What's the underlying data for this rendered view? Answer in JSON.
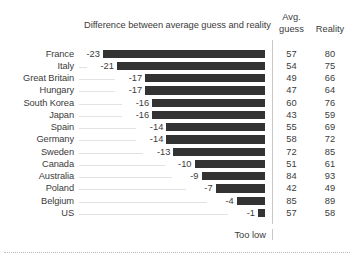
{
  "chart_data": {
    "type": "bar",
    "title": "",
    "subtitle": "Difference between average guess and reality",
    "xlabel": "",
    "ylabel": "",
    "orientation": "horizontal",
    "direction": "negative-right-aligned",
    "grid": false,
    "legend": null,
    "axis_note": "Too low",
    "xlim": [
      -23,
      0
    ],
    "columns": [
      "Difference between average guess and reality",
      "Avg. guess",
      "Reality"
    ],
    "column_headers": {
      "avg_line1": "Avg.",
      "avg_line2": "guess",
      "reality": "Reality"
    },
    "categories": [
      "France",
      "Italy",
      "Great Britain",
      "Hungary",
      "South Korea",
      "Japan",
      "Spain",
      "Germany",
      "Sweden",
      "Canada",
      "Australia",
      "Poland",
      "Belgium",
      "US"
    ],
    "values": [
      -23,
      -21,
      -17,
      -17,
      -16,
      -16,
      -14,
      -14,
      -13,
      -10,
      -9,
      -7,
      -4,
      -1
    ],
    "series": [
      {
        "name": "Difference",
        "values": [
          -23,
          -21,
          -17,
          -17,
          -16,
          -16,
          -14,
          -14,
          -13,
          -10,
          -9,
          -7,
          -4,
          -1
        ]
      },
      {
        "name": "Avg. guess",
        "values": [
          57,
          54,
          49,
          47,
          60,
          43,
          55,
          58,
          72,
          51,
          84,
          42,
          85,
          57
        ]
      },
      {
        "name": "Reality",
        "values": [
          80,
          75,
          66,
          64,
          76,
          59,
          69,
          72,
          85,
          61,
          93,
          49,
          89,
          58
        ]
      }
    ],
    "rows": [
      {
        "country": "France",
        "diff": "-23",
        "value": -23,
        "guess": "57",
        "reality": "80"
      },
      {
        "country": "Italy",
        "diff": "-21",
        "value": -21,
        "guess": "54",
        "reality": "75"
      },
      {
        "country": "Great Britain",
        "diff": "-17",
        "value": -17,
        "guess": "49",
        "reality": "66"
      },
      {
        "country": "Hungary",
        "diff": "-17",
        "value": -17,
        "guess": "47",
        "reality": "64"
      },
      {
        "country": "South Korea",
        "diff": "-16",
        "value": -16,
        "guess": "60",
        "reality": "76"
      },
      {
        "country": "Japan",
        "diff": "-16",
        "value": -16,
        "guess": "43",
        "reality": "59"
      },
      {
        "country": "Spain",
        "diff": "-14",
        "value": -14,
        "guess": "55",
        "reality": "69"
      },
      {
        "country": "Germany",
        "diff": "-14",
        "value": -14,
        "guess": "58",
        "reality": "72"
      },
      {
        "country": "Sweden",
        "diff": "-13",
        "value": -13,
        "guess": "72",
        "reality": "85"
      },
      {
        "country": "Canada",
        "diff": "-10",
        "value": -10,
        "guess": "51",
        "reality": "61"
      },
      {
        "country": "Australia",
        "diff": "-9",
        "value": -9,
        "guess": "84",
        "reality": "93"
      },
      {
        "country": "Poland",
        "diff": "-7",
        "value": -7,
        "guess": "42",
        "reality": "49"
      },
      {
        "country": "Belgium",
        "diff": "-4",
        "value": -4,
        "guess": "85",
        "reality": "89"
      },
      {
        "country": "US",
        "diff": "-1",
        "value": -1,
        "guess": "57",
        "reality": "58"
      }
    ],
    "colors": {
      "bar": "#333333",
      "text": "#3b3b3b",
      "leader": "#e2e2e2",
      "divider": "#c9c9c9",
      "background": "#ffffff"
    }
  }
}
